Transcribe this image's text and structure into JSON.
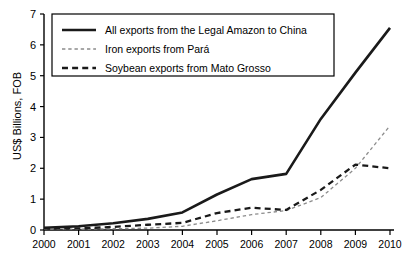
{
  "chart_data": {
    "type": "line",
    "title": "",
    "xlabel": "",
    "ylabel": "US$ Billions, FOB",
    "x": [
      2000,
      2001,
      2002,
      2003,
      2004,
      2005,
      2006,
      2007,
      2008,
      2009,
      2010
    ],
    "categories": [
      "2000",
      "2001",
      "2002",
      "2003",
      "2004",
      "2005",
      "2006",
      "2007",
      "2008",
      "2009",
      "2010"
    ],
    "xlim": [
      2000,
      2010
    ],
    "ylim": [
      0,
      7
    ],
    "ytick_labels": [
      "0",
      "1",
      "2",
      "3",
      "4",
      "5",
      "6",
      "7"
    ],
    "yticks": [
      0,
      1,
      2,
      3,
      4,
      5,
      6,
      7
    ],
    "grid": false,
    "legend_position": "top-left",
    "series": [
      {
        "name": "All exports from the Legal Amazon to China",
        "style": "solid",
        "color": "#1a1a1a",
        "width": 2.6,
        "values": [
          0.07,
          0.12,
          0.22,
          0.36,
          0.57,
          1.15,
          1.65,
          1.82,
          3.6,
          5.1,
          6.55
        ]
      },
      {
        "name": "Iron exports from Pará",
        "style": "dotted",
        "color": "#8c8c8c",
        "width": 1.3,
        "values": [
          0.03,
          0.03,
          0.04,
          0.06,
          0.12,
          0.3,
          0.5,
          0.63,
          1.05,
          2.0,
          3.38
        ]
      },
      {
        "name": "Soybean exports from Mato Grosso",
        "style": "dashed",
        "color": "#1a1a1a",
        "width": 2.3,
        "values": [
          0.05,
          0.05,
          0.1,
          0.17,
          0.23,
          0.55,
          0.72,
          0.65,
          1.3,
          2.12,
          2.0
        ]
      }
    ]
  },
  "axes": {
    "y_axis_title": "US$ Billions, FOB"
  }
}
